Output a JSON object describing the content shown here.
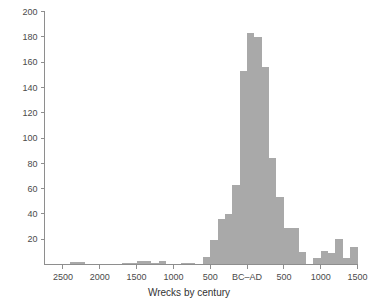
{
  "chart_data": {
    "type": "bar",
    "title": "",
    "subtitle": "",
    "xlabel": "Wrecks by century",
    "ylabel": "",
    "grid": false,
    "legend": null,
    "bar_color": "#a9a9a9",
    "axis_color": "#8e8e8e",
    "background": "#ffffff",
    "ylim": [
      0,
      200
    ],
    "yticks": [
      20,
      40,
      60,
      80,
      100,
      120,
      140,
      160,
      180,
      200
    ],
    "ytick_labels": [
      "20",
      "40",
      "60",
      "80",
      "100",
      "120",
      "140",
      "160",
      "180",
      "200"
    ],
    "xlim": [
      -2750,
      1500
    ],
    "xticks": [
      -2500,
      -2000,
      -1500,
      -1000,
      -500,
      0,
      500,
      1000,
      1500
    ],
    "xtick_labels": [
      "2500",
      "2000",
      "1500",
      "1000",
      "500",
      "BC–AD",
      "500",
      "1000",
      "1500"
    ],
    "bin_width": 100,
    "categories": [
      "2700 BC",
      "2600 BC",
      "2500 BC",
      "2400 BC",
      "2300 BC",
      "2200 BC",
      "2100 BC",
      "2000 BC",
      "1900 BC",
      "1800 BC",
      "1700 BC",
      "1600 BC",
      "1500 BC",
      "1400 BC",
      "1300 BC",
      "1200 BC",
      "1100 BC",
      "1000 BC",
      "900 BC",
      "800 BC",
      "700 BC",
      "600 BC",
      "500 BC",
      "400 BC",
      "300 BC",
      "200 BC",
      "100 BC",
      "AD 1",
      "AD 100",
      "AD 200",
      "AD 300",
      "AD 400",
      "AD 500",
      "AD 600",
      "AD 700",
      "AD 800",
      "AD 900",
      "AD 1000",
      "AD 1100",
      "AD 1200",
      "AD 1300",
      "AD 1400"
    ],
    "x": [
      -2700,
      -2600,
      -2500,
      -2400,
      -2300,
      -2200,
      -2100,
      -2000,
      -1900,
      -1800,
      -1700,
      -1600,
      -1500,
      -1400,
      -1300,
      -1200,
      -1100,
      -1000,
      -900,
      -800,
      -700,
      -600,
      -500,
      -400,
      -300,
      -200,
      -100,
      0,
      100,
      200,
      300,
      400,
      500,
      600,
      700,
      800,
      900,
      1000,
      1100,
      1200,
      1300,
      1400
    ],
    "values": [
      0,
      0,
      0,
      2,
      2,
      0,
      0,
      0,
      0,
      0,
      1,
      1,
      3,
      3,
      1,
      3,
      0,
      0,
      1,
      1,
      0,
      6,
      19,
      36,
      40,
      63,
      153,
      183,
      180,
      156,
      84,
      53,
      29,
      29,
      10,
      0,
      5,
      11,
      9,
      20,
      5,
      14
    ],
    "peak_value": 183,
    "peak_category": "AD 1"
  },
  "figure": {
    "axis_title_label": "Wrecks by century"
  }
}
